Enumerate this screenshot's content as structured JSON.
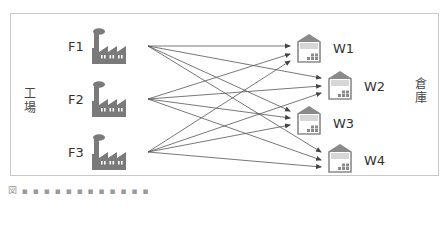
{
  "diagram": {
    "type": "bipartite-flow",
    "left_group_label": "工場",
    "right_group_label": "倉庫",
    "factories": [
      {
        "id": "F1",
        "label": "F1",
        "icon": "factory-icon"
      },
      {
        "id": "F2",
        "label": "F2",
        "icon": "factory-icon"
      },
      {
        "id": "F3",
        "label": "F3",
        "icon": "factory-icon"
      }
    ],
    "warehouses": [
      {
        "id": "W1",
        "label": "W1",
        "icon": "warehouse-icon"
      },
      {
        "id": "W2",
        "label": "W2",
        "icon": "warehouse-icon"
      },
      {
        "id": "W3",
        "label": "W3",
        "icon": "warehouse-icon"
      },
      {
        "id": "W4",
        "label": "W4",
        "icon": "warehouse-icon"
      }
    ],
    "edges": [
      {
        "from": "F1",
        "to": "W1"
      },
      {
        "from": "F1",
        "to": "W2"
      },
      {
        "from": "F1",
        "to": "W3"
      },
      {
        "from": "F1",
        "to": "W4"
      },
      {
        "from": "F2",
        "to": "W1"
      },
      {
        "from": "F2",
        "to": "W2"
      },
      {
        "from": "F2",
        "to": "W3"
      },
      {
        "from": "F2",
        "to": "W4"
      },
      {
        "from": "F3",
        "to": "W1"
      },
      {
        "from": "F3",
        "to": "W2"
      },
      {
        "from": "F3",
        "to": "W3"
      },
      {
        "from": "F3",
        "to": "W4"
      }
    ],
    "colors": {
      "icon": "#7a7a7a",
      "warehouse_stroke": "#8a8a8a",
      "edge": "#555555",
      "frame": "#c8c8c8"
    },
    "caption": "図 ▪ ▪ ▪ ▪ ▪ ▪ ▪ ▪ ▪ ▪ ▪ ▪"
  }
}
